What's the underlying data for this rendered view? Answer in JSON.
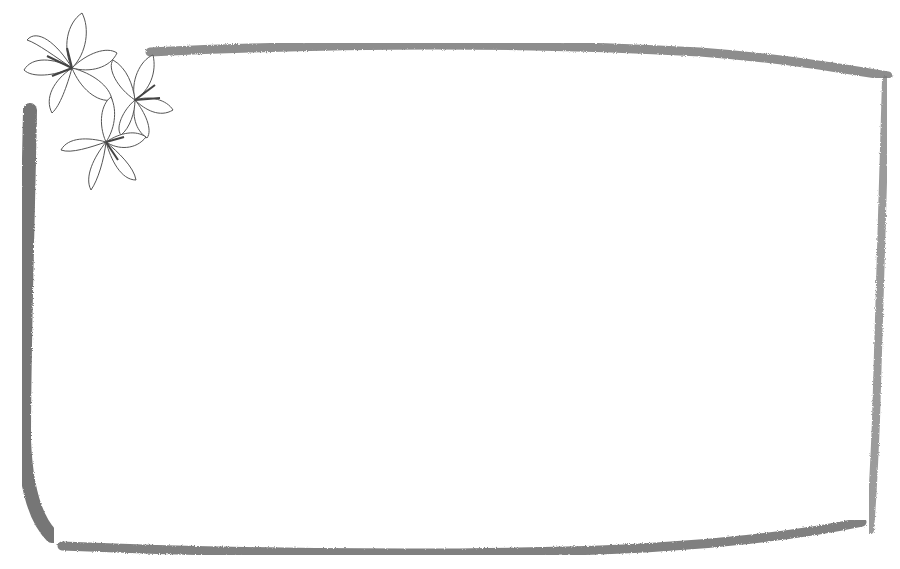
{
  "image": {
    "description": "Decorative pencil-sketch rectangular frame with a cluster of three lily flowers at the top-left corner",
    "background": "#ffffff",
    "stroke_color": "#6e6e6e",
    "flower_line_color": "#5a5a5a",
    "content_text": ""
  },
  "frame": {
    "corner_ornament": "lily-cluster",
    "flower_count": 3
  }
}
